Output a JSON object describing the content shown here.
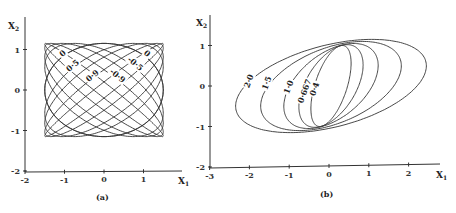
{
  "chart_data": [
    {
      "type": "line",
      "panel_label": "(a)",
      "xlabel": "X",
      "xlabel_sub": "1",
      "ylabel": "X",
      "ylabel_sub": "2",
      "xlim": [
        -2,
        1.9
      ],
      "ylim": [
        -2,
        1.3
      ],
      "xticks": [
        -2,
        -1,
        0,
        1
      ],
      "xtick_labels": [
        "-2",
        "-1",
        "0",
        "1"
      ],
      "yticks": [
        -2,
        -1,
        0,
        1
      ],
      "ytick_labels": [
        "-2",
        "-1",
        "0",
        "1"
      ],
      "grid": false,
      "description": "Family of ellipses x1 = 1.5 cos t, x2 = 1.15 cos(t + phi) forming a Lissajous-like pattern; curves labelled by correlation parameter",
      "series": [
        {
          "name": "0",
          "ax": 1.5,
          "ay": 1.15,
          "phase_deg": 90
        },
        {
          "name": "0·5",
          "ax": 1.5,
          "ay": 1.15,
          "phase_deg": 60
        },
        {
          "name": "0·9",
          "ax": 1.5,
          "ay": 1.15,
          "phase_deg": 25.8
        },
        {
          "name": "-0·9",
          "ax": 1.5,
          "ay": 1.15,
          "phase_deg": 154.2
        },
        {
          "name": "-0·5",
          "ax": 1.5,
          "ay": 1.15,
          "phase_deg": 120
        },
        {
          "name": "0",
          "ax": 1.5,
          "ay": 1.15,
          "phase_deg": 270
        },
        {
          "name": "",
          "ax": 1.5,
          "ay": 1.15,
          "phase_deg": 45
        },
        {
          "name": "",
          "ax": 1.5,
          "ay": 1.15,
          "phase_deg": 135
        },
        {
          "name": "",
          "ax": 1.5,
          "ay": 1.15,
          "phase_deg": 10
        },
        {
          "name": "",
          "ax": 1.5,
          "ay": 1.15,
          "phase_deg": 170
        }
      ],
      "annotations": [
        {
          "text": "0",
          "x": -1.0,
          "y": 0.85,
          "rotate": -40
        },
        {
          "text": "0·5",
          "x": -0.75,
          "y": 0.55,
          "rotate": -40
        },
        {
          "text": "0·9",
          "x": -0.25,
          "y": 0.3,
          "rotate": -40
        },
        {
          "text": "0",
          "x": 1.05,
          "y": 0.85,
          "rotate": 40
        },
        {
          "text": "-0·5",
          "x": 0.75,
          "y": 0.6,
          "rotate": 40
        },
        {
          "text": "-0·9",
          "x": 0.3,
          "y": 0.3,
          "rotate": 40
        }
      ]
    },
    {
      "type": "line",
      "panel_label": "(b)",
      "xlabel": "X",
      "xlabel_sub": "1",
      "ylabel": "X",
      "ylabel_sub": "2",
      "xlim": [
        -3,
        2.8
      ],
      "ylim": [
        -2,
        1.4
      ],
      "xticks": [
        -3,
        -2,
        -1,
        0,
        1,
        2
      ],
      "xtick_labels": [
        "-3",
        "-2",
        "-1",
        "0",
        "1",
        "2"
      ],
      "yticks": [
        -2,
        -1,
        0,
        1
      ],
      "ytick_labels": [
        "-2",
        "-1",
        "0",
        "1"
      ],
      "grid": false,
      "description": "Family of tilted ellipses sharing two common points near (-0.1, 0.95) and (0.1, -0.9), labelled by parameter value",
      "series": [
        {
          "name": "2·0",
          "a": 2.2,
          "m": 0.95,
          "b": 1.15
        },
        {
          "name": "1·5",
          "a": 1.6,
          "m": 0.75,
          "b": 1.1
        },
        {
          "name": "1·0",
          "a": 1.05,
          "m": 0.55,
          "b": 1.05
        },
        {
          "name": "0·667",
          "a": 0.7,
          "m": 0.4,
          "b": 1.02
        },
        {
          "name": "0·4",
          "a": 0.42,
          "m": 0.28,
          "b": 1.0
        }
      ],
      "annotations": [
        {
          "text": "2·0",
          "x": -1.95,
          "y": 0.1
        },
        {
          "text": "1·5",
          "x": -1.5,
          "y": 0.05
        },
        {
          "text": "1·0",
          "x": -0.95,
          "y": -0.05
        },
        {
          "text": "0·667",
          "x": -0.55,
          "y": -0.15
        },
        {
          "text": "0·4",
          "x": -0.3,
          "y": -0.1
        }
      ]
    }
  ]
}
